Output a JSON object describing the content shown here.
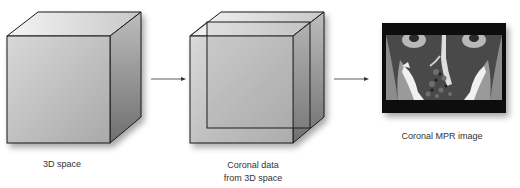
{
  "diagram": {
    "stages": [
      {
        "id": "3d-space",
        "label": "3D space"
      },
      {
        "id": "coronal-data",
        "label_line1": "Coronal data",
        "label_line2": "from 3D space"
      },
      {
        "id": "coronal-mpr",
        "label": "Coronal MPR image"
      }
    ],
    "arrows": [
      {
        "from": "3d-space",
        "to": "coronal-data"
      },
      {
        "from": "coronal-data",
        "to": "coronal-mpr"
      }
    ],
    "colors": {
      "stroke": "#1a1a1a",
      "face_light": "#e6e6e6",
      "face_dark": "#8a8a8a",
      "text": "#333333"
    }
  }
}
